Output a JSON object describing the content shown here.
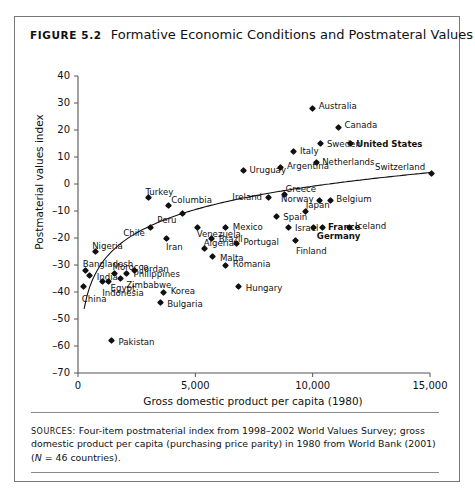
{
  "figure": {
    "number_label": "Figure 5.2",
    "title": "Formative Economic Conditions and Postmateral Values"
  },
  "source_note": {
    "caption": "Sources:",
    "line1": "Four-item postmaterial index from 1998–2002 World Values Survey; gross",
    "line2": "domestic product per capita (purchasing price parity) in 1980 from World Bank (2001)",
    "n_italic": "N",
    "line3": " = 46 countries)."
  },
  "chart_data": {
    "type": "scatter",
    "title": "Formative Economic Conditions and Postmateral Values",
    "xlabel": "Gross domestic product per capita (1980)",
    "ylabel": "Postmaterial values index",
    "xlim": [
      0,
      15000
    ],
    "ylim": [
      -70,
      40
    ],
    "xticks": [
      0,
      5000,
      10000,
      15000
    ],
    "xtick_labels": [
      "0",
      "5,000",
      "10,000",
      "15,000"
    ],
    "yticks": [
      40,
      30,
      20,
      10,
      0,
      -10,
      -20,
      -30,
      -40,
      -50,
      -60,
      -70
    ],
    "ytick_labels": [
      "40",
      "30",
      "20",
      "10",
      "0",
      "–10",
      "–20",
      "–30",
      "–40",
      "–50",
      "–60",
      "–70"
    ],
    "grid": false,
    "legend": "none",
    "trendline": "logarithmic fitted curve",
    "points": [
      {
        "name": "China",
        "x": 250,
        "y": -38,
        "lx": -2,
        "ly": 12,
        "align": "left",
        "bold": false
      },
      {
        "name": "India",
        "x": 500,
        "y": -34,
        "lx": 7,
        "ly": 1,
        "align": "left",
        "bold": false
      },
      {
        "name": "Bangladesh",
        "x": 330,
        "y": -32,
        "lx": -3,
        "ly": -6,
        "align": "left",
        "bold": false
      },
      {
        "name": "Pakistan",
        "x": 1430,
        "y": -58,
        "lx": 7,
        "ly": 1,
        "align": "left",
        "bold": false
      },
      {
        "name": "Nigeria",
        "x": 730,
        "y": -25,
        "lx": -3,
        "ly": -6,
        "align": "left",
        "bold": false
      },
      {
        "name": "Indonesia",
        "x": 1030,
        "y": -36,
        "lx": 0,
        "ly": 12,
        "align": "left",
        "bold": false
      },
      {
        "name": "Egypt",
        "x": 1300,
        "y": -36,
        "lx": 2,
        "ly": 7,
        "align": "left",
        "bold": false
      },
      {
        "name": "Morocco",
        "x": 1560,
        "y": -33,
        "lx": -2,
        "ly": -6,
        "align": "left",
        "bold": false
      },
      {
        "name": "Zimbabwe",
        "x": 1800,
        "y": -35,
        "lx": 6,
        "ly": 6,
        "align": "left",
        "bold": false
      },
      {
        "name": "Philippines",
        "x": 2070,
        "y": -33,
        "lx": 7,
        "ly": 1,
        "align": "left",
        "bold": false
      },
      {
        "name": "Jordan",
        "x": 2400,
        "y": -32,
        "lx": 7,
        "ly": -1,
        "align": "left",
        "bold": false
      },
      {
        "name": "Bulgaria",
        "x": 3500,
        "y": -44,
        "lx": 7,
        "ly": 1,
        "align": "left",
        "bold": false
      },
      {
        "name": "Korea",
        "x": 3650,
        "y": -40,
        "lx": 7,
        "ly": -1,
        "align": "left",
        "bold": false
      },
      {
        "name": "Algeria",
        "x": 5400,
        "y": -24,
        "lx": -1,
        "ly": -6,
        "align": "left",
        "bold": false
      },
      {
        "name": "Malta",
        "x": 5750,
        "y": -27,
        "lx": 7,
        "ly": 1,
        "align": "left",
        "bold": false
      },
      {
        "name": "Chile",
        "x": 3100,
        "y": -16,
        "lx": -6,
        "ly": 6,
        "align": "right",
        "bold": false
      },
      {
        "name": "Iran",
        "x": 3750,
        "y": -20,
        "lx": 0,
        "ly": 9,
        "align": "left",
        "bold": false
      },
      {
        "name": "Turkey",
        "x": 3000,
        "y": -5,
        "lx": -3,
        "ly": -6,
        "align": "left",
        "bold": false
      },
      {
        "name": "Columbia",
        "x": 3850,
        "y": -8,
        "lx": 3,
        "ly": -6,
        "align": "left",
        "bold": false
      },
      {
        "name": "Peru",
        "x": 4450,
        "y": -11,
        "lx": -6,
        "ly": 6,
        "align": "right",
        "bold": false
      },
      {
        "name": "Venezuela",
        "x": 5100,
        "y": -16,
        "lx": -1,
        "ly": 7,
        "align": "left",
        "bold": false
      },
      {
        "name": "Brazil",
        "x": 5700,
        "y": -20,
        "lx": 7,
        "ly": 1,
        "align": "left",
        "bold": false
      },
      {
        "name": "Mexico",
        "x": 6300,
        "y": -16,
        "lx": 7,
        "ly": 0,
        "align": "left",
        "bold": false
      },
      {
        "name": "Portugal",
        "x": 6750,
        "y": -22,
        "lx": 7,
        "ly": -1,
        "align": "left",
        "bold": false
      },
      {
        "name": "Romania",
        "x": 6300,
        "y": -30,
        "lx": 7,
        "ly": -1,
        "align": "left",
        "bold": false
      },
      {
        "name": "Hungary",
        "x": 6850,
        "y": -38,
        "lx": 7,
        "ly": 1,
        "align": "left",
        "bold": false
      },
      {
        "name": "Uruguay",
        "x": 7050,
        "y": 5,
        "lx": 6,
        "ly": -1,
        "align": "left",
        "bold": false
      },
      {
        "name": "Argentina",
        "x": 8650,
        "y": 6,
        "lx": 6,
        "ly": -2,
        "align": "left",
        "bold": false
      },
      {
        "name": "Ireland",
        "x": 8100,
        "y": -5,
        "lx": -6,
        "ly": -1,
        "align": "right",
        "bold": false
      },
      {
        "name": "Greece",
        "x": 8800,
        "y": -4,
        "lx": 1,
        "ly": -6,
        "align": "left",
        "bold": false
      },
      {
        "name": "Spain",
        "x": 8450,
        "y": -12,
        "lx": 7,
        "ly": 1,
        "align": "left",
        "bold": false
      },
      {
        "name": "Israel",
        "x": 8950,
        "y": -16,
        "lx": 7,
        "ly": 1,
        "align": "left",
        "bold": false
      },
      {
        "name": "Finland",
        "x": 9250,
        "y": -21,
        "lx": 1,
        "ly": 10,
        "align": "left",
        "bold": false
      },
      {
        "name": "Japan",
        "x": 9700,
        "y": -10,
        "lx": 0,
        "ly": -6,
        "align": "left",
        "bold": false
      },
      {
        "name": "Italy",
        "x": 9200,
        "y": 12,
        "lx": 6,
        "ly": -1,
        "align": "left",
        "bold": false
      },
      {
        "name": "Australia",
        "x": 10000,
        "y": 28,
        "lx": 6,
        "ly": -2,
        "align": "left",
        "bold": false
      },
      {
        "name": "Netherlands",
        "x": 10150,
        "y": 8,
        "lx": 6,
        "ly": 0,
        "align": "left",
        "bold": false
      },
      {
        "name": "Sweden",
        "x": 10350,
        "y": 15,
        "lx": 6,
        "ly": 0,
        "align": "left",
        "bold": false
      },
      {
        "name": "Canada",
        "x": 11100,
        "y": 21,
        "lx": 6,
        "ly": -2,
        "align": "left",
        "bold": false
      },
      {
        "name": "Norway",
        "x": 10300,
        "y": -6,
        "lx": -6,
        "ly": -1,
        "align": "right",
        "bold": false
      },
      {
        "name": "Belgium",
        "x": 10750,
        "y": -6,
        "lx": 6,
        "ly": -1,
        "align": "left",
        "bold": false
      },
      {
        "name": "Germany",
        "x": 10050,
        "y": -16,
        "lx": 3,
        "ly": 9,
        "align": "left",
        "bold": true
      },
      {
        "name": "France",
        "x": 10400,
        "y": -16,
        "lx": 6,
        "ly": 0,
        "align": "left",
        "bold": true
      },
      {
        "name": "Iceland",
        "x": 11550,
        "y": -16,
        "lx": 6,
        "ly": -1,
        "align": "left",
        "bold": false
      },
      {
        "name": "United States",
        "x": 11600,
        "y": 15,
        "lx": 6,
        "ly": 0,
        "align": "left",
        "bold": true
      },
      {
        "name": "Switzerland",
        "x": 15050,
        "y": 4,
        "lx": -6,
        "ly": -6,
        "align": "right",
        "bold": false
      }
    ]
  },
  "colors": {
    "marker": "#111111",
    "axis": "#555555",
    "frame": "#777777",
    "text": "#111111"
  }
}
